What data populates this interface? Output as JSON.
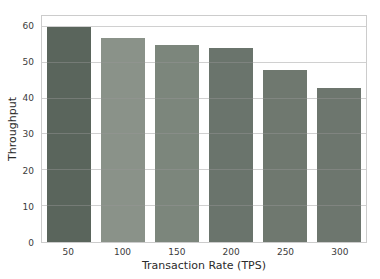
{
  "chart_data": {
    "type": "bar",
    "title": "",
    "xlabel": "Transaction Rate (TPS)",
    "ylabel": "Throughput",
    "categories": [
      "50",
      "100",
      "150",
      "200",
      "250",
      "300"
    ],
    "values": [
      60,
      57,
      55,
      54,
      48,
      43
    ],
    "bar_colors": [
      "#5a655c",
      "#8a9289",
      "#7c867c",
      "#6a746c",
      "#6f786f",
      "#6d766e"
    ],
    "yticks": [
      0,
      10,
      20,
      30,
      40,
      50,
      60
    ],
    "ylim": [
      0,
      63
    ],
    "grid": "horizontal",
    "gridline_color": "rgba(150,150,150,0.45)",
    "spine_color": "#cccccc",
    "background_color": "#ffffff",
    "legend": "none"
  }
}
